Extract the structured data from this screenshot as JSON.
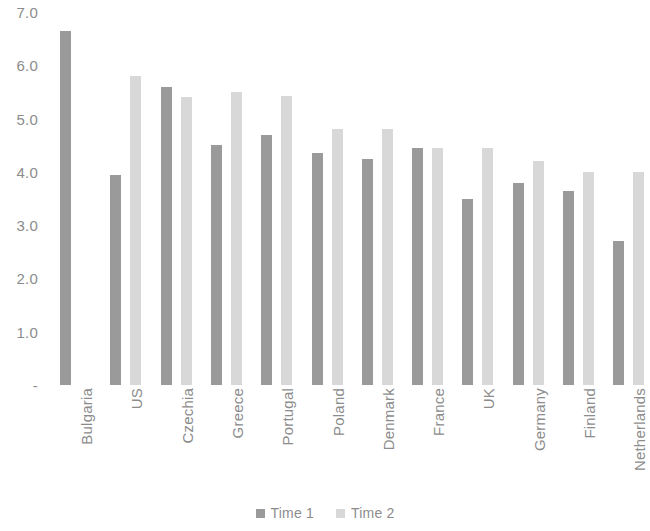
{
  "chart_data": {
    "type": "bar",
    "title": "",
    "subtitle": "",
    "xlabel": "",
    "ylabel": "",
    "ylim": [
      0,
      7.0
    ],
    "grid": false,
    "legend_position": "bottom",
    "y_ticks": [
      "-",
      "1.0",
      "2.0",
      "3.0",
      "4.0",
      "5.0",
      "6.0",
      "7.0"
    ],
    "y_tick_values": [
      0,
      1.0,
      2.0,
      3.0,
      4.0,
      5.0,
      6.0,
      7.0
    ],
    "categories": [
      "Bulgaria",
      "US",
      "Czechia",
      "Greece",
      "Portugal",
      "Poland",
      "Denmark",
      "France",
      "UK",
      "Germany",
      "Finland",
      "Netherlands"
    ],
    "series": [
      {
        "name": "Time 1",
        "color": "#9a9a9a",
        "values": [
          6.65,
          3.95,
          5.6,
          4.5,
          4.7,
          4.35,
          4.25,
          4.45,
          3.5,
          3.8,
          3.65,
          2.7
        ]
      },
      {
        "name": "Time 2",
        "color": "#d8d8d8",
        "values": [
          null,
          5.8,
          5.4,
          5.5,
          5.42,
          4.8,
          4.8,
          4.45,
          4.45,
          4.2,
          4.0,
          4.0
        ]
      }
    ]
  },
  "legend": {
    "items": [
      {
        "label": "Time 1",
        "color": "#9a9a9a"
      },
      {
        "label": "Time 2",
        "color": "#d8d8d8"
      }
    ]
  },
  "axis_text_color": "#8c8c8c"
}
